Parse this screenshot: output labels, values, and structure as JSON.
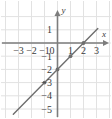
{
  "figure": {
    "background_color": "#ffffff",
    "grid_color": "#e2e2e2",
    "axis_color": "#7d7d7d",
    "line_color": "#6e6e6e",
    "text_color": "#3a3a3a"
  },
  "axes": {
    "x_axis_label": "x",
    "y_axis_label": "y",
    "x_ticks": [
      {
        "value": -3,
        "label": "−3"
      },
      {
        "value": -2,
        "label": "−2"
      },
      {
        "value": -1,
        "label": "−1"
      },
      {
        "value": 1,
        "label": "1"
      },
      {
        "value": 2,
        "label": "2"
      },
      {
        "value": 3,
        "label": "3"
      }
    ],
    "y_ticks": [
      {
        "value": 1,
        "label": "1"
      },
      {
        "value": -1,
        "label": "−1"
      },
      {
        "value": -2,
        "label": "−2"
      },
      {
        "value": -3,
        "label": "−3"
      },
      {
        "value": -4,
        "label": "−4"
      },
      {
        "value": -5,
        "label": "−5"
      }
    ],
    "origin_label": "0"
  },
  "chart_data": {
    "type": "line",
    "title": "",
    "xlabel": "x",
    "ylabel": "y",
    "xlim": [
      -3.6,
      3.6
    ],
    "ylim": [
      -5.6,
      1.6
    ],
    "grid": true,
    "legend": null,
    "series": [
      {
        "name": "y = x - 2",
        "slope": 1,
        "intercept": -2,
        "x": [
          -3.4,
          3.1
        ],
        "y": [
          -5.4,
          1.1
        ],
        "points": [
          {
            "x": -1,
            "y": -3
          },
          {
            "x": 0,
            "y": -2
          },
          {
            "x": 1,
            "y": -1
          },
          {
            "x": 2,
            "y": 0
          }
        ]
      }
    ],
    "x_tick_values": [
      -3,
      -2,
      -1,
      0,
      1,
      2,
      3
    ],
    "y_tick_values": [
      1,
      0,
      -1,
      -2,
      -3,
      -4,
      -5
    ]
  }
}
